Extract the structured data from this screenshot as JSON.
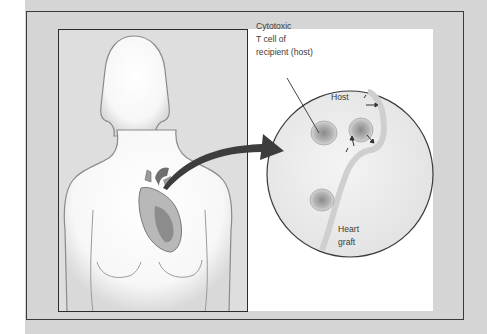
{
  "figure": {
    "labels": {
      "tcell": [
        "Cytotoxic",
        "T cell of",
        "recipient (host)"
      ],
      "host": "Host",
      "graft": [
        "Heart",
        "graft"
      ]
    },
    "elements": {
      "body_silhouette": "female-torso",
      "organ": "heart",
      "callout": "magnified-circle",
      "arrow": "curved-arrow"
    },
    "colors": {
      "background": "#d5d5d5",
      "panel": "#dedede",
      "outline": "#3a3a3a",
      "arrow": "#3a3a3a",
      "text": "#3c3c3c"
    }
  }
}
